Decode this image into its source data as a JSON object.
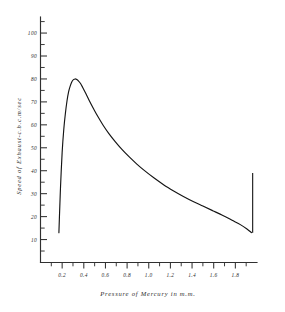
{
  "chart_data": {
    "type": "line",
    "title": "",
    "xlabel": "Pressure of Mercury in m.m.",
    "ylabel": "Speed of Exhaust-c.b.c.m/sec",
    "xlim": [
      0.0,
      2.0
    ],
    "ylim": [
      0,
      107
    ],
    "grid": false,
    "legend": null,
    "x_tick_labels": [
      "0.2",
      "0.4",
      "0.6",
      "0.8",
      "1.0",
      "1.2",
      "1.4",
      "1.6",
      "1.8"
    ],
    "x_tick_values": [
      0.2,
      0.4,
      0.6,
      0.8,
      1.0,
      1.2,
      1.4,
      1.6,
      1.8
    ],
    "x_minor_tick_values": [
      0.1,
      0.3,
      0.5,
      0.7,
      0.9,
      1.1,
      1.3,
      1.5,
      1.7,
      1.9
    ],
    "y_tick_labels": [
      "10",
      "20",
      "30",
      "40",
      "50",
      "60",
      "70",
      "80",
      "90",
      "100"
    ],
    "y_tick_values": [
      10,
      20,
      30,
      40,
      50,
      60,
      70,
      80,
      90,
      100
    ],
    "y_minor_tick_values": [
      5,
      15,
      25,
      35,
      45,
      55,
      65,
      75,
      85,
      95,
      105
    ],
    "series": [
      {
        "name": "Speed of exhaust",
        "x": [
          0.17,
          0.175,
          0.185,
          0.2,
          0.215,
          0.23,
          0.245,
          0.26,
          0.275,
          0.29,
          0.305,
          0.32,
          0.335,
          0.35,
          0.37,
          0.39,
          0.42,
          0.45,
          0.49,
          0.53,
          0.58,
          0.63,
          0.69,
          0.75,
          0.82,
          0.89,
          0.97,
          1.05,
          1.14,
          1.23,
          1.32,
          1.41,
          1.5,
          1.59,
          1.68,
          1.77,
          1.85,
          1.91,
          1.95
        ],
        "y": [
          13.0,
          20.0,
          33.0,
          48.0,
          58.0,
          65.0,
          70.5,
          74.5,
          77.0,
          78.8,
          79.7,
          80.0,
          79.8,
          79.2,
          78.0,
          76.3,
          73.5,
          70.6,
          67.0,
          63.6,
          59.7,
          56.3,
          52.7,
          49.4,
          46.0,
          42.9,
          39.7,
          36.8,
          33.8,
          31.2,
          28.8,
          26.6,
          24.6,
          22.6,
          20.6,
          18.4,
          16.4,
          14.5,
          13.0
        ]
      }
    ],
    "annotations": [
      {
        "name": "right-edge-riser",
        "type": "vertical-segment",
        "x": 1.96,
        "y_from": 13.0,
        "y_to": 39.0
      }
    ]
  }
}
